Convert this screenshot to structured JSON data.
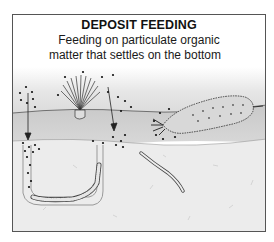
{
  "figure": {
    "title": "DEPOSIT FEEDING",
    "subtitle_line1": "Feeding on particulate organic",
    "subtitle_line2": "matter that settles on the bottom"
  },
  "colors": {
    "frame": "#555555",
    "water_top": "#f4f4f4",
    "water_bottom": "#cfcfcf",
    "sediment_surface": "#d6d6d6",
    "sediment": "#ececec",
    "particle": "#111111"
  },
  "organisms": [
    {
      "name": "fan-worm (suspension/deposit feeder tentacle crown)"
    },
    {
      "name": "sea cucumber"
    },
    {
      "name": "burrowing worm in U-shaped burrow"
    },
    {
      "name": "small burrowing worm"
    }
  ]
}
